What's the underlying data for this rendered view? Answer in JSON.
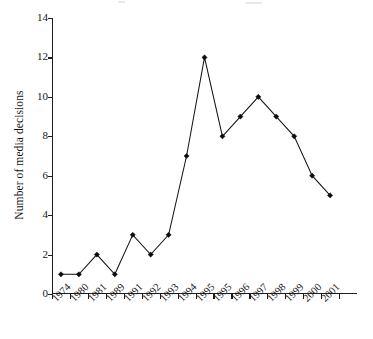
{
  "chart_data": {
    "type": "line",
    "title": "",
    "subtitle": "",
    "xlabel": "",
    "ylabel": "Number of media decisions",
    "categories": [
      "1974",
      "1980",
      "1981",
      "1989",
      "1991",
      "1992",
      "1993",
      "1994",
      "1995",
      "1995",
      "1996",
      "1997",
      "1998",
      "1999",
      "2000",
      "2001"
    ],
    "values": [
      1,
      1,
      2,
      1,
      3,
      2,
      3,
      7,
      12,
      8,
      9,
      10,
      9,
      8,
      6,
      5
    ],
    "series": [
      {
        "name": "Number of media decisions",
        "values": [
          1,
          1,
          2,
          1,
          3,
          2,
          3,
          7,
          12,
          8,
          9,
          10,
          9,
          8,
          6,
          5
        ]
      }
    ],
    "points": [
      {
        "x": "1974",
        "y": 1
      },
      {
        "x": "1980",
        "y": 1
      },
      {
        "x": "1981",
        "y": 2
      },
      {
        "x": "1989",
        "y": 1
      },
      {
        "x": "1991",
        "y": 3
      },
      {
        "x": "1992",
        "y": 2
      },
      {
        "x": "1993",
        "y": 3
      },
      {
        "x": "1994",
        "y": 7
      },
      {
        "x": "1995",
        "y": 12
      },
      {
        "x": "1995",
        "y": 8
      },
      {
        "x": "1996",
        "y": 9
      },
      {
        "x": "1997",
        "y": 10
      },
      {
        "x": "1998",
        "y": 9
      },
      {
        "x": "1999",
        "y": 8
      },
      {
        "x": "2000",
        "y": 6
      },
      {
        "x": "2001",
        "y": 5
      }
    ],
    "ylim": [
      0,
      14
    ],
    "yticks": [
      0,
      2,
      4,
      6,
      8,
      10,
      12,
      14
    ],
    "ytick_labels": [
      "0",
      "2",
      "4",
      "6",
      "8",
      "10",
      "12",
      "14"
    ],
    "xtick_labels": [
      "1974",
      "1980",
      "1981",
      "1989",
      "1991",
      "1992",
      "1993",
      "1994",
      "1995",
      "1995",
      "1996",
      "1997",
      "1998",
      "1999",
      "2000",
      "2001"
    ],
    "grid": false,
    "legend": null,
    "legend_position": "none",
    "marker": "filled-diamond",
    "line_color": "#141414",
    "marker_color": "#0d0d0d",
    "axis_color": "#1d1d1d",
    "background_color": "#ffffff",
    "xtick_label_rotation": -45
  }
}
